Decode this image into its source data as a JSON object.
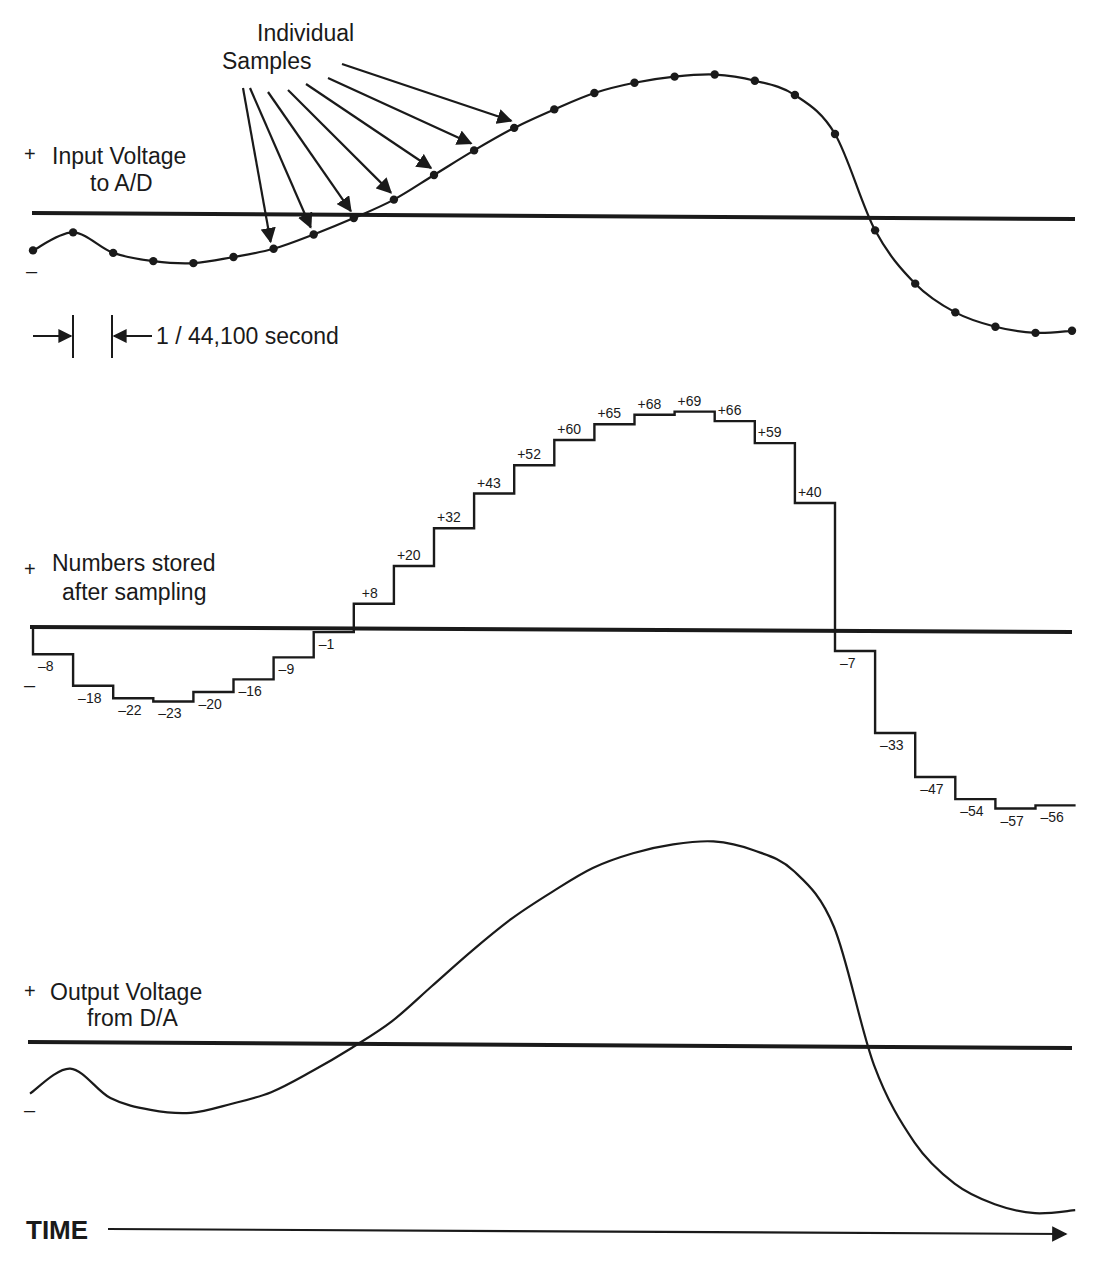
{
  "figure": {
    "panels": [
      {
        "id": "input",
        "label_lines": [
          "Input Voltage",
          "to A/D"
        ],
        "plus": "+",
        "minus": "–"
      },
      {
        "id": "stored",
        "label_lines": [
          "Numbers stored",
          "after sampling"
        ],
        "plus": "+",
        "minus": "–"
      },
      {
        "id": "output",
        "label_lines": [
          "Output Voltage",
          "from D/A"
        ],
        "plus": "+",
        "minus": "–"
      }
    ],
    "callout": {
      "line1": "Individual",
      "line2": "Samples"
    },
    "interval": {
      "label": "1 / 44,100 second"
    },
    "time_axis": {
      "label": "TIME"
    }
  },
  "samples": {
    "values": [
      -8,
      -18,
      -22,
      -23,
      -20,
      -16,
      -9,
      -1,
      8,
      20,
      32,
      43,
      52,
      60,
      65,
      68,
      69,
      66,
      59,
      40,
      -7,
      -33,
      -47,
      -54,
      -57,
      -56
    ],
    "labels": [
      "–8",
      "–18",
      "–22",
      "–23",
      "–20",
      "–16",
      "–9",
      "–1",
      "+8",
      "+20",
      "+32",
      "+43",
      "+52",
      "+60",
      "+65",
      "+68",
      "+69",
      "+66",
      "+59",
      "+40",
      "–7",
      "–33",
      "–47",
      "–54",
      "–57",
      "–56"
    ]
  },
  "colors": {
    "ink": "#1a1a1a",
    "background": "#ffffff"
  }
}
